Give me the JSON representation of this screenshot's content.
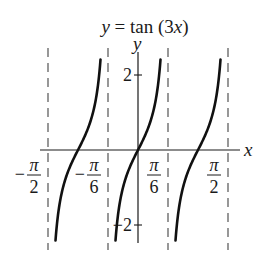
{
  "chart_data": {
    "type": "line",
    "title": "y = tan (3x)",
    "title_parts": {
      "lhs": "y",
      "eq": " = tan (3",
      "var": "x",
      "close": ")"
    },
    "xlabel": "x",
    "ylabel": "y",
    "function": "tan(3x)",
    "xlim": [
      -1.7,
      1.75
    ],
    "ylim": [
      -3.3,
      3.3
    ],
    "asymptotes": [
      {
        "x": -1.5708,
        "label": "-π/2"
      },
      {
        "x": -0.5236,
        "label": "-π/6"
      },
      {
        "x": 0.5236,
        "label": "π/6"
      },
      {
        "x": 1.5708,
        "label": "π/2"
      }
    ],
    "x_ticks": [
      {
        "value": -1.5708,
        "num": "π",
        "den": "2",
        "sign": "−"
      },
      {
        "value": -0.5236,
        "num": "π",
        "den": "6",
        "sign": "−"
      },
      {
        "value": 0.5236,
        "num": "π",
        "den": "6",
        "sign": ""
      },
      {
        "value": 1.5708,
        "num": "π",
        "den": "2",
        "sign": ""
      }
    ],
    "y_ticks": [
      {
        "value": 2,
        "label": "2"
      },
      {
        "value": -2,
        "label": "−2"
      }
    ],
    "branches": [
      {
        "center": -1.0472,
        "x_range": [
          -1.5708,
          -0.5236
        ]
      },
      {
        "center": 0,
        "x_range": [
          -0.5236,
          0.5236
        ]
      },
      {
        "center": 1.0472,
        "x_range": [
          0.5236,
          1.5708
        ]
      }
    ],
    "grid": false
  }
}
